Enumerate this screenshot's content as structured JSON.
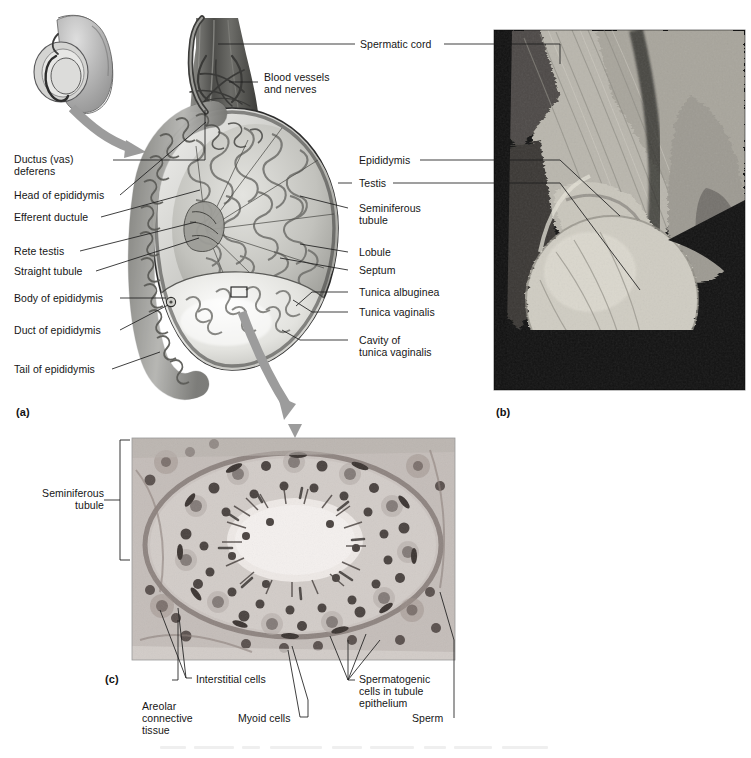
{
  "figure": {
    "panels": [
      {
        "id": "a",
        "label": "(a)",
        "kind": "illustration",
        "caption": "Sagittal section of the testis and epididymis"
      },
      {
        "id": "b",
        "label": "(b)",
        "kind": "photograph",
        "caption": "Cadaver photograph of testis and spermatic cord"
      },
      {
        "id": "c",
        "label": "(c)",
        "kind": "micrograph",
        "caption": "Light micrograph of seminiferous tubule cross section"
      }
    ]
  },
  "panel_a": {
    "id": "(a)",
    "labels_left": [
      {
        "name": "ductus-vas-deferens",
        "text": "Ductus (vas)\ndeferens"
      },
      {
        "name": "head-of-epididymis",
        "text": "Head of epididymis"
      },
      {
        "name": "efferent-ductule",
        "text": "Efferent ductule"
      },
      {
        "name": "rete-testis",
        "text": "Rete testis"
      },
      {
        "name": "straight-tubule",
        "text": "Straight tubule"
      },
      {
        "name": "body-of-epididymis",
        "text": "Body of epididymis"
      },
      {
        "name": "duct-of-epididymis",
        "text": "Duct of epididymis"
      },
      {
        "name": "tail-of-epididymis",
        "text": "Tail of epididymis"
      }
    ],
    "labels_right": [
      {
        "name": "spermatic-cord",
        "text": "Spermatic cord"
      },
      {
        "name": "blood-vessels-and-nerves",
        "text": "Blood vessels\nand nerves"
      },
      {
        "name": "seminiferous-tubule",
        "text": "Seminiferous\ntubule"
      },
      {
        "name": "lobule",
        "text": "Lobule"
      },
      {
        "name": "septum",
        "text": "Septum"
      },
      {
        "name": "tunica-albuginea",
        "text": "Tunica albuginea"
      },
      {
        "name": "tunica-vaginalis",
        "text": "Tunica vaginalis"
      },
      {
        "name": "cavity-of-tunica-vaginalis",
        "text": "Cavity of\ntunica vaginalis"
      }
    ],
    "inset": {
      "name": "orientation-inset",
      "description": "penis and scrotum orientation diagram"
    }
  },
  "panel_b": {
    "id": "(b)",
    "labels": [
      {
        "name": "epididymis",
        "text": "Epididymis"
      },
      {
        "name": "testis",
        "text": "Testis"
      }
    ]
  },
  "panel_c": {
    "id": "(c)",
    "labels": [
      {
        "name": "seminiferous-tubule",
        "text": "Seminiferous\ntubule"
      },
      {
        "name": "interstitial-cells",
        "text": "Interstitial cells"
      },
      {
        "name": "areolar-connective-tissue",
        "text": "Areolar\nconnective\ntissue"
      },
      {
        "name": "myoid-cells",
        "text": "Myoid cells"
      },
      {
        "name": "spermatogenic-cells",
        "text": "Spermatogenic\ncells in tubule\nepithelium"
      },
      {
        "name": "sperm",
        "text": "Sperm"
      }
    ]
  },
  "colors": {
    "background": "#ffffff",
    "ink": "#1a1a1a",
    "leader": "#1e1e1e",
    "arrow_gray": "#9a9a9a",
    "tissue_light": "#d8d8d4",
    "tissue_mid": "#b0b0ac",
    "tissue_dark": "#6e6e6a",
    "photo_dark": "#141414"
  }
}
